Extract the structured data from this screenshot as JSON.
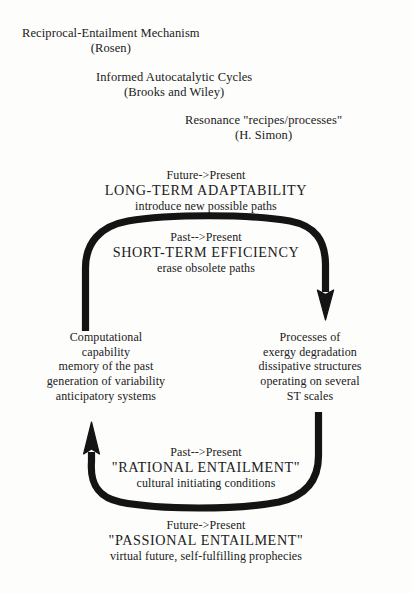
{
  "figure": {
    "ink_color": "#141414",
    "background_color": "#fdfdfc"
  },
  "headers": [
    {
      "name": "rosen",
      "line1": "Reciprocal-Entailment Mechanism",
      "line2": "(Rosen)"
    },
    {
      "name": "brooks-wiley",
      "line1": "Informed Autocatalytic Cycles",
      "line2": "(Brooks and Wiley)"
    },
    {
      "name": "simon",
      "line1": "Resonance \"recipes/processes\"",
      "line2": "(H. Simon)"
    }
  ],
  "cycle_labels": {
    "long_term": {
      "direction": "Future->Present",
      "title": "LONG-TERM ADAPTABILITY",
      "description": "introduce new possible paths"
    },
    "short_term": {
      "direction": "Past-->Present",
      "title": "SHORT-TERM EFFICIENCY",
      "description": "erase obsolete paths"
    },
    "rational": {
      "direction": "Past-->Present",
      "title": "\"RATIONAL ENTAILMENT\"",
      "description": "cultural initiating conditions"
    },
    "passional": {
      "direction": "Future->Present",
      "title": "\"PASSIONAL ENTAILMENT\"",
      "description": "virtual future, self-fulfilling prophecies"
    }
  },
  "columns": {
    "left": {
      "name": "computational-capability",
      "lines": [
        "Computational",
        "capability",
        "memory of the past",
        "generation of variability",
        "anticipatory systems"
      ]
    },
    "right": {
      "name": "exergy-degradation",
      "lines": [
        "Processes of",
        "exergy degradation",
        "dissipative structures",
        "operating on several",
        "ST scales"
      ]
    }
  },
  "arrows": [
    {
      "name": "top-arc-arrow",
      "from": "left-column",
      "to": "right-column",
      "direction": "clockwise-down-right"
    },
    {
      "name": "bottom-arc-arrow",
      "from": "right-column",
      "to": "left-column",
      "direction": "counterclockwise-up-left"
    }
  ]
}
